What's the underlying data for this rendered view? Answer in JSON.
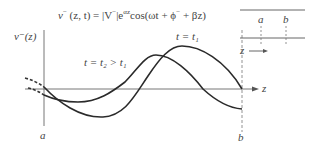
{
  "equation": {
    "text": "v⁻ (z, t) = |V⁻|e^{αz}cos(ωt + φ⁻ + βz)",
    "lhs": "v",
    "lhs_sup": "−",
    "lhs_args": " (z, t) = |V",
    "abs_sup": "−",
    "mid": "|e",
    "exp": "αz",
    "cos": "cos(ωt + ϕ",
    "phi_sup": "−",
    "tail": " + βz)"
  },
  "plot": {
    "y_axis_label": "v⁻(z)",
    "x_axis_label": "z",
    "left_marker": "a",
    "right_marker": "b",
    "curves": [
      {
        "name": "t = t1",
        "label": "t = t₁",
        "style": "solid"
      },
      {
        "name": "t = t2 > t1",
        "label": "t = t₂ > t₁",
        "style": "solid"
      }
    ]
  },
  "inset": {
    "marker_a": "a",
    "marker_b": "b",
    "direction_label": "z"
  }
}
